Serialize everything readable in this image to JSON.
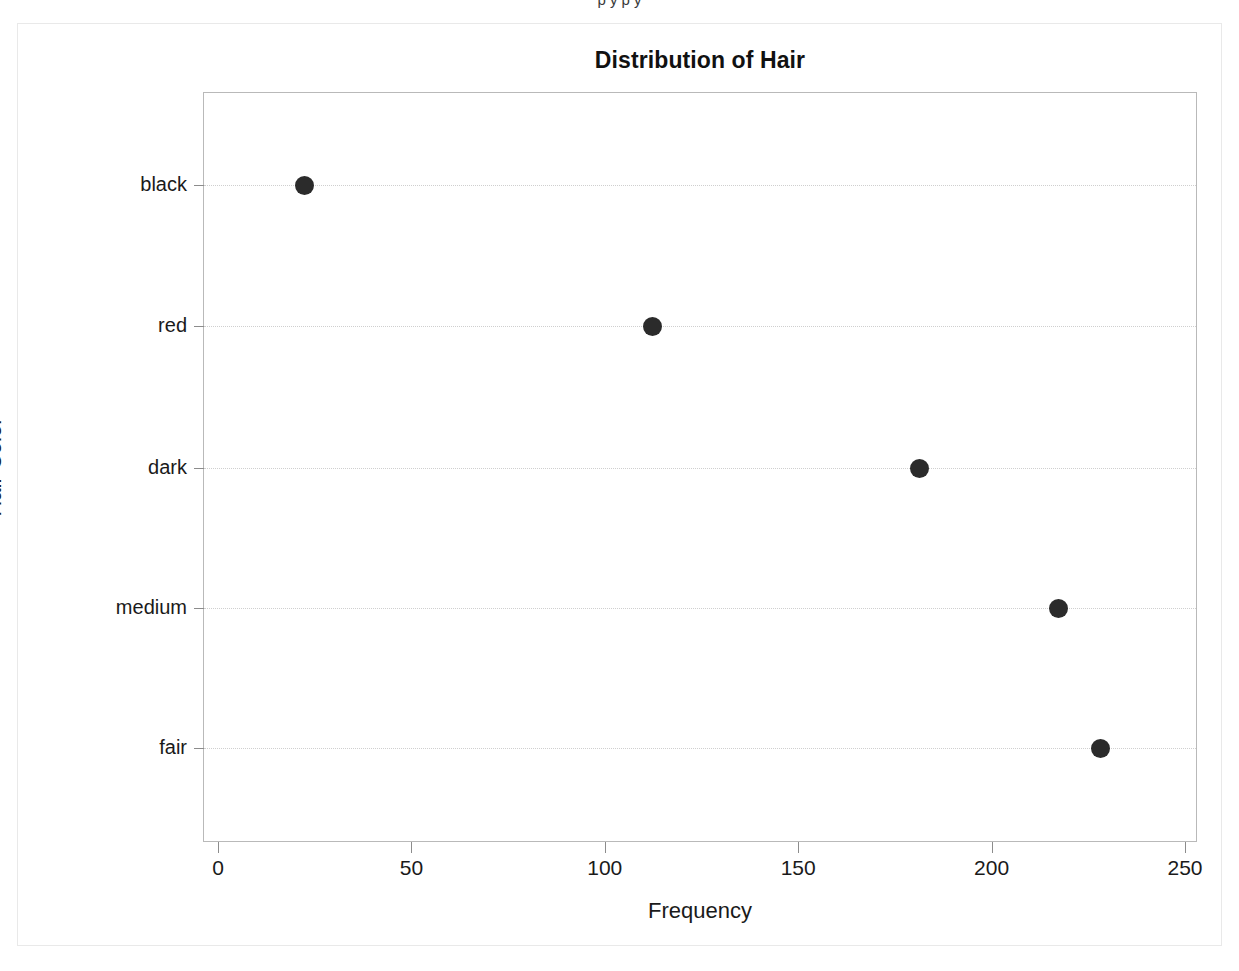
{
  "page": {
    "background_color": "#ffffff",
    "border_color": "#e9e9e9",
    "clipped_header_text": "p       y      p y"
  },
  "chart_data": {
    "type": "scatter",
    "title": "Distribution of Hair",
    "xlabel": "Frequency",
    "ylabel": "Hair Color",
    "categories": [
      "black",
      "red",
      "dark",
      "medium",
      "fair"
    ],
    "values": [
      22,
      112,
      181,
      217,
      228
    ],
    "points": [
      {
        "category": "black",
        "value": 22
      },
      {
        "category": "red",
        "value": 112
      },
      {
        "category": "dark",
        "value": 181
      },
      {
        "category": "medium",
        "value": 217
      },
      {
        "category": "fair",
        "value": 228
      }
    ],
    "xlim": [
      0,
      250
    ],
    "xticks": [
      0,
      50,
      100,
      150,
      200,
      250
    ],
    "xtick_labels": [
      "0",
      "50",
      "100",
      "150",
      "200",
      "250"
    ],
    "grid": true,
    "grid_orientation": "horizontal",
    "grid_style": "dotted",
    "legend": null,
    "marker": {
      "shape": "circle",
      "color": "#2b2b2b",
      "size_px": 19
    },
    "axis_color": "#8c8c8c",
    "gridline_color": "#cfcfcf",
    "plot_frame_color": "#b9b9b9",
    "title_color": "#111111"
  },
  "geometry": {
    "plot_left": 203,
    "plot_top": 92,
    "plot_width": 994,
    "plot_height": 750,
    "x_axis_pixel_min": 15,
    "x_axis_pixel_max": 982,
    "category_pixel_y": [
      92,
      233,
      375,
      515,
      655
    ]
  }
}
